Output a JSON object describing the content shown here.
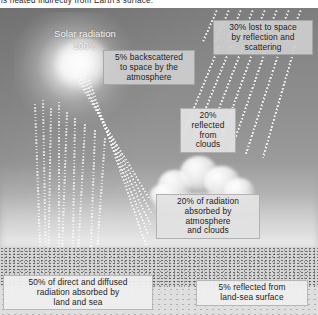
{
  "caption": {
    "text": "is heated indirectly from Earth's surface."
  },
  "figure": {
    "sun_label": {
      "title": "Solar radiation",
      "percent": "100%"
    },
    "callouts": [
      {
        "id": "backscatter",
        "lines": [
          "5% backscattered",
          "to space by the",
          "atmosphere"
        ],
        "percent": "5%"
      },
      {
        "id": "lost-space",
        "lines": [
          "30% lost to space",
          "by reflection and",
          "scattering"
        ],
        "percent": "30%"
      },
      {
        "id": "clouds",
        "lines": [
          "20%",
          "reflected",
          "from",
          "clouds"
        ],
        "percent": "20%"
      },
      {
        "id": "absorbed",
        "lines": [
          "20% of radiation",
          "absorbed by",
          "atmosphere",
          "and clouds"
        ],
        "percent": "20%"
      },
      {
        "id": "land-sea",
        "lines": [
          "50% of direct and diffused",
          "radiation absorbed by",
          "land and sea"
        ],
        "percent": "50%"
      },
      {
        "id": "reflected",
        "lines": [
          "5% reflected from",
          "land-sea surface"
        ],
        "percent": "5%"
      }
    ],
    "elements": {
      "sun": "sun-glow",
      "cloud": "cumulus-cloud",
      "ground": "land-sea-surface"
    },
    "colors": {
      "sky_top": "#7d7d7d",
      "sky_horizon": "#ebebeb",
      "ground": "#d4d4d4",
      "box_fill": "#cecece",
      "text": "#1d1d1d",
      "ray": "#ffffff"
    }
  }
}
